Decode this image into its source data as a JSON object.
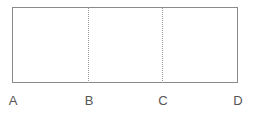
{
  "diagram": {
    "labels": [
      "A",
      "B",
      "C",
      "D"
    ],
    "segments": [
      "A-B",
      "B-C",
      "C-D"
    ],
    "stroke_color": "#8a8a8a",
    "divider_style": "dotted"
  }
}
